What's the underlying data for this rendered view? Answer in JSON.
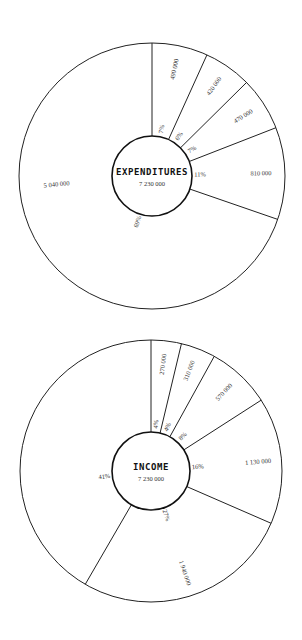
{
  "chart_data": [
    {
      "type": "pie",
      "style": "donut",
      "title": "EXPENDITURES",
      "total_label": "7 230 000",
      "total": 7230000,
      "direction": "clockwise from top",
      "slices": [
        {
          "value": 490000,
          "value_label": "490 000",
          "pct_label": "7%"
        },
        {
          "value": 420000,
          "value_label": "420 000",
          "pct_label": "6%"
        },
        {
          "value": 470000,
          "value_label": "470 000",
          "pct_label": "7%"
        },
        {
          "value": 810000,
          "value_label": "810 000",
          "pct_label": "11%"
        },
        {
          "value": 5040000,
          "value_label": "5 040 000",
          "pct_label": "69%"
        }
      ]
    },
    {
      "type": "pie",
      "style": "donut",
      "title": "INCOME",
      "total_label": "7 230 000",
      "total": 7230000,
      "direction": "clockwise from top",
      "slices": [
        {
          "value": 270000,
          "value_label": "270 000",
          "pct_label": "4%"
        },
        {
          "value": 310000,
          "value_label": "310 000",
          "pct_label": "4%"
        },
        {
          "value": 570000,
          "value_label": "570 000",
          "pct_label": "8%"
        },
        {
          "value": 1130000,
          "value_label": "1 130 000",
          "pct_label": "16%"
        },
        {
          "value": 1940000,
          "value_label": "1 940 000",
          "pct_label": "27%"
        },
        {
          "value": 3010000,
          "value_label": "",
          "pct_label": "41%"
        }
      ]
    }
  ]
}
